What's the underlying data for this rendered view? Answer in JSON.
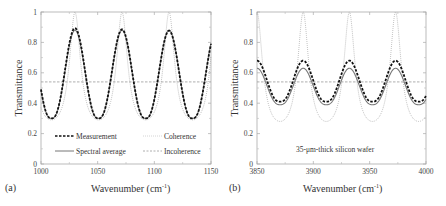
{
  "chart_data": [
    {
      "type": "line",
      "panel_label": "(a)",
      "title": "",
      "xlabel": "Wavenumber (cm⁻¹)",
      "ylabel": "Transmittance",
      "xlim": [
        1000,
        1150
      ],
      "ylim": [
        0,
        1
      ],
      "xticks": [
        "1000",
        "1050",
        "1100",
        "1150"
      ],
      "yticks": [
        "0",
        "0.2",
        "0.4",
        "0.6",
        "0.8",
        "1"
      ],
      "grid": false,
      "legend_position": "lower inside",
      "legend": [
        {
          "name": "Measurement",
          "style": "thick dashed black"
        },
        {
          "name": "Coherence",
          "style": "dotted light gray"
        },
        {
          "name": "Spectral average",
          "style": "solid gray"
        },
        {
          "name": "Incoherence",
          "style": "dashed gray"
        }
      ],
      "series": [
        {
          "name": "Measurement",
          "period": 41.5,
          "first_peak": 1030,
          "max": [
            0.9,
            0.89,
            0.87
          ],
          "min": 0.3
        },
        {
          "name": "Coherence",
          "period": 41.5,
          "first_peak": 1030,
          "max": 1.0,
          "min": 0.29
        },
        {
          "name": "Spectral average",
          "period": 41.5,
          "first_peak": 1030,
          "max": 0.88,
          "min": 0.3
        },
        {
          "name": "Incoherence",
          "constant": 0.54
        }
      ],
      "peaks_x": [
        1030,
        1072,
        1113
      ],
      "troughs_x": [
        1010,
        1051,
        1092,
        1134
      ]
    },
    {
      "type": "line",
      "panel_label": "(b)",
      "title": "",
      "annotation": "35-μm-thick silicon wafer",
      "xlabel": "Wavenumber (cm⁻¹)",
      "ylabel": "Transmittance",
      "xlim": [
        3850,
        4000
      ],
      "ylim": [
        0,
        1
      ],
      "xticks": [
        "3850",
        "3900",
        "3950",
        "4000"
      ],
      "yticks": [
        "0",
        "0.2",
        "0.4",
        "0.6",
        "0.8",
        "1"
      ],
      "grid": false,
      "series": [
        {
          "name": "Measurement",
          "period": 41,
          "first_peak": 3891,
          "max": 0.68,
          "min": 0.41
        },
        {
          "name": "Coherence",
          "period": 41,
          "first_peak": 3850,
          "max": 1.0,
          "min": 0.28
        },
        {
          "name": "Spectral average",
          "period": 41,
          "first_peak": 3891,
          "max": 0.63,
          "min": 0.39
        },
        {
          "name": "Incoherence",
          "constant": 0.54
        }
      ],
      "peaks_x": [
        3850,
        3891,
        3932,
        3973
      ],
      "troughs_x": [
        3872,
        3912,
        3953,
        3994
      ]
    }
  ],
  "labels": {
    "panel_a": "(a)",
    "panel_b": "(b)",
    "xlabel_a": "Wavenumber (cm",
    "xlabel_b": "Wavenumber (cm",
    "sup": "-1",
    "close": ")",
    "ylabel": "Transmittance",
    "annotation_b": "35-μm-thick silicon wafer",
    "legend": {
      "measurement": "Measurement",
      "coherence": "Coherence",
      "spectral": "Spectral average",
      "incoherence": "Incoherence"
    }
  }
}
